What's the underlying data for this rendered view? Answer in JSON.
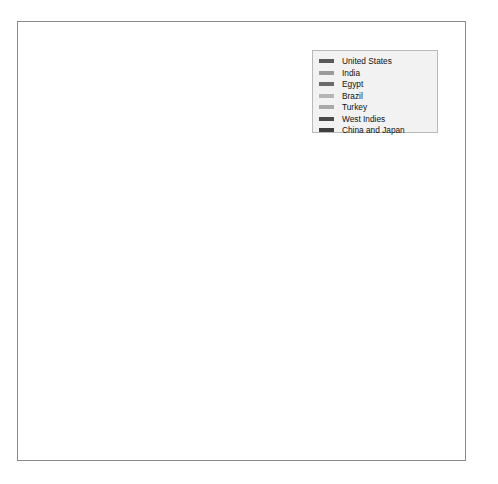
{
  "chart_data": {
    "type": "line",
    "title": "",
    "xlabel": "",
    "ylabel": "Cotton imports per thousand 400-pound bales",
    "x": [
      1860,
      1861,
      1862,
      1863,
      1864,
      1865,
      1866,
      1867,
      1868,
      1869,
      1870
    ],
    "xtick_labels": [
      "1860",
      "1861",
      "1862",
      "1863",
      "1864",
      "1865",
      "1866",
      "1867",
      "1868",
      "1869",
      "1870"
    ],
    "ytick_labels": [
      "0",
      "500",
      "1000",
      "1500",
      "2000",
      "2500",
      "3000",
      "3500",
      "4000"
    ],
    "ytick_values": [
      0,
      500,
      1000,
      1500,
      2000,
      2500,
      3000,
      3500,
      4000
    ],
    "xlim": [
      1860,
      1870
    ],
    "ylim": [
      0,
      4200
    ],
    "grid": false,
    "legend_position": "top-right",
    "legend_title": "",
    "series": [
      {
        "name": "United States",
        "color": "#595959",
        "values": [
          4050,
          3050,
          15,
          35,
          50,
          75,
          560,
          680,
          800,
          830,
          780
        ]
      },
      {
        "name": "India",
        "color": "#9a9a9a",
        "values": [
          560,
          975,
          1030,
          1180,
          1395,
          1255,
          1745,
          1430,
          1530,
          1605,
          1105
        ]
      },
      {
        "name": "Egypt",
        "color": "#6b6b6b",
        "values": [
          105,
          110,
          135,
          200,
          240,
          295,
          290,
          290,
          300,
          340,
          310
        ]
      },
      {
        "name": "Brazil",
        "color": "#b5b5b5",
        "values": [
          25,
          30,
          50,
          95,
          145,
          190,
          230,
          265,
          305,
          345,
          405
        ]
      },
      {
        "name": "Turkey",
        "color": "#a8a8a8",
        "values": [
          15,
          20,
          35,
          85,
          150,
          215,
          210,
          200,
          215,
          195,
          215
        ]
      },
      {
        "name": "West Indies",
        "color": "#4a4a4a",
        "values": [
          35,
          40,
          55,
          110,
          195,
          255,
          185,
          130,
          95,
          130,
          205
        ]
      },
      {
        "name": "China and Japan",
        "color": "#3f3f3f",
        "values": [
          20,
          25,
          40,
          115,
          235,
          540,
          1600,
          1690,
          1975,
          1600,
          2385
        ]
      }
    ]
  },
  "legend": {
    "items": [
      {
        "label": "United States",
        "color": "#595959"
      },
      {
        "label": "India",
        "color": "#9a9a9a"
      },
      {
        "label": "Egypt",
        "color": "#6b6b6b"
      },
      {
        "label": "Brazil",
        "color": "#b5b5b5"
      },
      {
        "label": "Turkey",
        "color": "#a8a8a8"
      },
      {
        "label": "West Indies",
        "color": "#4a4a4a"
      },
      {
        "label": "China and Japan",
        "color": "#3f3f3f"
      }
    ]
  }
}
